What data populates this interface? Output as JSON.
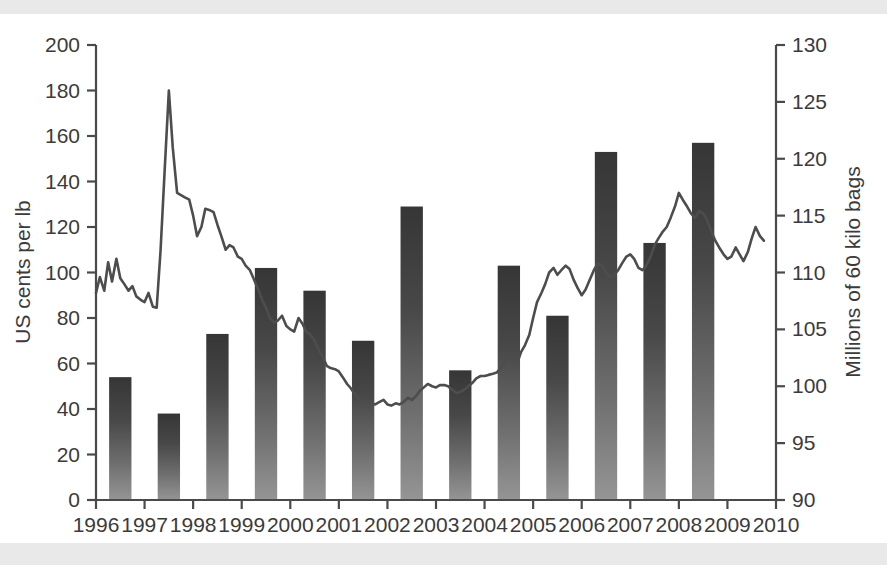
{
  "chart_data": {
    "type": "bar",
    "title": "",
    "subtitle": "",
    "xlabel": "",
    "ylabel": "US cents per lb",
    "y2label": "Millions of 60 kilo bags",
    "grid": false,
    "legend": "none",
    "categories": [
      "1996",
      "1997",
      "1998",
      "1999",
      "2000",
      "2001",
      "2002",
      "2003",
      "2004",
      "2005",
      "2006",
      "2007",
      "2008",
      "2009"
    ],
    "x_tick_labels": [
      "1996",
      "1997",
      "1998",
      "1999",
      "2000",
      "2001",
      "2002",
      "2003",
      "2004",
      "2005",
      "2006",
      "2007",
      "2008",
      "2009",
      "2010"
    ],
    "ylim": [
      0,
      200
    ],
    "y_ticks": [
      0,
      20,
      40,
      60,
      80,
      100,
      120,
      140,
      160,
      180,
      200
    ],
    "y2lim": [
      90,
      130
    ],
    "y2_ticks": [
      90,
      95,
      100,
      105,
      110,
      115,
      120,
      125,
      130
    ],
    "series": [
      {
        "name": "Production (millions of 60 kilo bags)",
        "type": "bar",
        "axis": "left",
        "values": [
          54,
          38,
          73,
          102,
          92,
          70,
          129,
          57,
          103,
          81,
          153,
          113,
          157,
          null
        ]
      },
      {
        "name": "Price (US cents per lb)",
        "type": "line",
        "axis": "right",
        "x": [
          1996.0,
          1996.08,
          1996.17,
          1996.25,
          1996.33,
          1996.42,
          1996.5,
          1996.58,
          1996.67,
          1996.75,
          1996.83,
          1996.92,
          1997.0,
          1997.08,
          1997.17,
          1997.25,
          1997.33,
          1997.42,
          1997.5,
          1997.58,
          1997.67,
          1997.75,
          1997.83,
          1997.92,
          1998.0,
          1998.08,
          1998.17,
          1998.25,
          1998.33,
          1998.42,
          1998.5,
          1998.58,
          1998.67,
          1998.75,
          1998.83,
          1998.92,
          1999.0,
          1999.08,
          1999.17,
          1999.25,
          1999.33,
          1999.42,
          1999.5,
          1999.58,
          1999.67,
          1999.75,
          1999.83,
          1999.92,
          2000.0,
          2000.08,
          2000.17,
          2000.25,
          2000.33,
          2000.42,
          2000.5,
          2000.58,
          2000.67,
          2000.75,
          2000.83,
          2000.92,
          2001.0,
          2001.08,
          2001.17,
          2001.25,
          2001.33,
          2001.42,
          2001.5,
          2001.58,
          2001.67,
          2001.75,
          2001.83,
          2001.92,
          2002.0,
          2002.08,
          2002.17,
          2002.25,
          2002.33,
          2002.42,
          2002.5,
          2002.58,
          2002.67,
          2002.75,
          2002.83,
          2002.92,
          2003.0,
          2003.08,
          2003.17,
          2003.25,
          2003.33,
          2003.42,
          2003.5,
          2003.58,
          2003.67,
          2003.75,
          2003.83,
          2003.92,
          2004.0,
          2004.08,
          2004.17,
          2004.25,
          2004.33,
          2004.42,
          2004.5,
          2004.58,
          2004.67,
          2004.75,
          2004.83,
          2004.92,
          2005.0,
          2005.08,
          2005.17,
          2005.25,
          2005.33,
          2005.42,
          2005.5,
          2005.58,
          2005.67,
          2005.75,
          2005.83,
          2005.92,
          2006.0,
          2006.08,
          2006.17,
          2006.25,
          2006.33,
          2006.42,
          2006.5,
          2006.58,
          2006.67,
          2006.75,
          2006.83,
          2006.92,
          2007.0,
          2007.08,
          2007.17,
          2007.25,
          2007.33,
          2007.42,
          2007.5,
          2007.58,
          2007.67,
          2007.75,
          2007.83,
          2007.92,
          2008.0,
          2008.08,
          2008.17,
          2008.25,
          2008.33,
          2008.42,
          2008.5,
          2008.58,
          2008.67,
          2008.75,
          2008.83,
          2008.92,
          2009.0,
          2009.08,
          2009.17,
          2009.25,
          2009.33,
          2009.42,
          2009.5,
          2009.58,
          2009.67,
          2009.75
        ],
        "values": [
          108.2,
          109.6,
          108.4,
          110.9,
          109.2,
          111.2,
          109.5,
          109.0,
          108.4,
          108.8,
          107.9,
          107.6,
          107.4,
          108.2,
          107.0,
          106.9,
          112.0,
          119.5,
          126.0,
          121.0,
          117.0,
          116.8,
          116.6,
          116.4,
          115.0,
          113.2,
          114.0,
          115.6,
          115.5,
          115.3,
          114.2,
          113.2,
          112.0,
          112.4,
          112.2,
          111.4,
          111.2,
          110.6,
          110.2,
          109.4,
          108.6,
          107.6,
          106.9,
          106.0,
          105.6,
          105.8,
          106.2,
          105.3,
          105.0,
          104.8,
          106.0,
          105.5,
          104.8,
          104.5,
          104.0,
          103.2,
          102.6,
          101.8,
          101.6,
          101.5,
          101.3,
          100.8,
          100.2,
          99.8,
          99.3,
          98.9,
          98.6,
          98.6,
          98.5,
          98.4,
          98.6,
          98.8,
          98.4,
          98.3,
          98.5,
          98.4,
          98.6,
          99.0,
          98.8,
          99.1,
          99.6,
          99.9,
          100.2,
          100.0,
          99.9,
          100.1,
          100.1,
          100.0,
          99.7,
          99.4,
          99.5,
          99.7,
          100.0,
          100.3,
          100.7,
          100.9,
          100.9,
          101.0,
          101.1,
          101.2,
          101.6,
          102.1,
          102.4,
          102.2,
          102.0,
          103.0,
          103.6,
          104.5,
          106.0,
          107.4,
          108.2,
          109.0,
          110.0,
          110.4,
          109.8,
          110.2,
          110.6,
          110.3,
          109.4,
          108.6,
          108.0,
          108.5,
          109.4,
          110.2,
          110.8,
          110.6,
          110.0,
          109.6,
          109.8,
          110.2,
          110.8,
          111.4,
          111.6,
          111.2,
          110.4,
          110.2,
          110.6,
          111.4,
          112.4,
          113.0,
          113.6,
          114.0,
          114.8,
          115.8,
          117.0,
          116.4,
          115.8,
          115.2,
          114.8,
          115.4,
          115.2,
          114.6,
          113.6,
          112.8,
          112.2,
          111.6,
          111.2,
          111.4,
          112.2,
          111.6,
          111.0,
          111.8,
          113.0,
          114.0,
          113.2,
          112.8
        ]
      }
    ]
  },
  "axes": {
    "left_title": "US cents per lb",
    "right_title": "Millions of 60 kilo bags"
  },
  "colors": {
    "bar_top": "#3a3a3a",
    "bar_bottom": "#8e8e8e",
    "line": "#4d4d4d",
    "axis": "#4a4a4a",
    "text": "#3b3b3b",
    "background": "#ffffff",
    "scan_band": "#e9e9e9"
  }
}
